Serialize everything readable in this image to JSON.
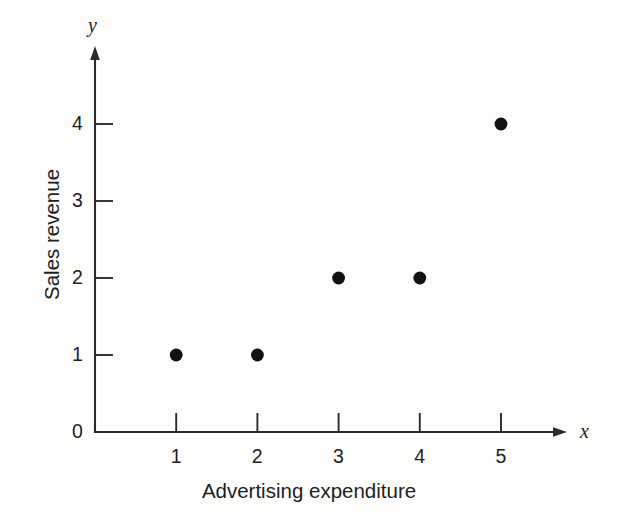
{
  "figure": {
    "background_color": "#fdfdfc",
    "ink_color": "#1f1f1f",
    "point_color": "#111111"
  },
  "chart_data": {
    "type": "scatter",
    "title": "",
    "subtitle": "",
    "xlabel": "Advertising expenditure",
    "ylabel": "Sales revenue",
    "x_axis_variable": "x",
    "y_axis_variable": "y",
    "x": [
      1,
      2,
      3,
      4,
      5
    ],
    "y": [
      1,
      1,
      2,
      2,
      4
    ],
    "points": [
      {
        "x": 1,
        "y": 1
      },
      {
        "x": 2,
        "y": 1
      },
      {
        "x": 3,
        "y": 2
      },
      {
        "x": 4,
        "y": 2
      },
      {
        "x": 5,
        "y": 4
      }
    ],
    "xticks": [
      1,
      2,
      3,
      4,
      5
    ],
    "yticks": [
      0,
      1,
      2,
      3,
      4
    ],
    "xtick_labels": [
      "1",
      "2",
      "3",
      "4",
      "5"
    ],
    "ytick_labels": [
      "0",
      "1",
      "2",
      "3",
      "4"
    ],
    "xlim": [
      0,
      5.9
    ],
    "ylim": [
      0,
      5.0
    ],
    "grid": false,
    "legend": null,
    "annotations": [],
    "tick_direction": "in",
    "axis_arrows": true
  }
}
